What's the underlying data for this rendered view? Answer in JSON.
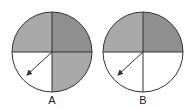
{
  "diagrams": [
    {
      "label": "A",
      "quadrants": {
        "top_left": "#a9a9a9",
        "top_right": "#8f8f8f",
        "bottom_right": "#a9a9a9",
        "bottom_left": "#ffffff"
      }
    },
    {
      "label": "B",
      "quadrants": {
        "top_left": "#a9a9a9",
        "top_right": "#8f8f8f",
        "bottom_right": "#ffffff",
        "bottom_left": "#ffffff"
      }
    }
  ],
  "colors": {
    "outline": "#333333",
    "arrow": "#333333"
  }
}
